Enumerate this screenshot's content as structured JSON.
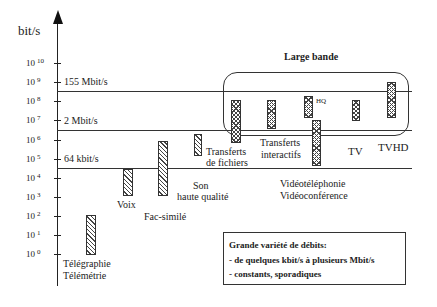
{
  "chart": {
    "y_axis_label": "bit/s",
    "ticks": [
      {
        "exp": "10",
        "y": 63
      },
      {
        "exp": "9",
        "y": 82
      },
      {
        "exp": "8",
        "y": 101
      },
      {
        "exp": "7",
        "y": 120
      },
      {
        "exp": "6",
        "y": 140
      },
      {
        "exp": "5",
        "y": 159
      },
      {
        "exp": "4",
        "y": 178
      },
      {
        "exp": "3",
        "y": 197
      },
      {
        "exp": "2",
        "y": 216
      },
      {
        "exp": "1",
        "y": 235
      },
      {
        "exp": "0",
        "y": 254
      }
    ],
    "reference_lines": [
      {
        "label": "155 Mbit/s",
        "y": 91
      },
      {
        "label": "2 Mbit/s",
        "y": 130
      },
      {
        "label": "64 kbit/s",
        "y": 168
      }
    ],
    "group_label": "Large bande",
    "services": [
      {
        "label": "Télégraphie",
        "label2": "Télémétrie",
        "style": "hatch"
      },
      {
        "label": "Voix",
        "style": "hatch"
      },
      {
        "label": "Fac-similé",
        "style": "hatch"
      },
      {
        "label": "Son",
        "label2": "haute qualité",
        "style": "hatch"
      },
      {
        "label": "Transferts",
        "label2": "de fichiers",
        "style": "cross"
      },
      {
        "label": "Transferts",
        "label2": "interactifs",
        "style": "cross"
      },
      {
        "label": "HQ",
        "style": "cross"
      },
      {
        "label": "Vidéotéléphonie",
        "label2": "Vidéoconférence",
        "style": "cross"
      },
      {
        "label": "TV",
        "style": "cross"
      },
      {
        "label": "TVHD",
        "style": "cross"
      }
    ],
    "note": {
      "title": "Grande variété de débits:",
      "line1": "- de quelques kbit/s à plusieurs Mbit/s",
      "line2": "- constants, sporadiques"
    }
  }
}
